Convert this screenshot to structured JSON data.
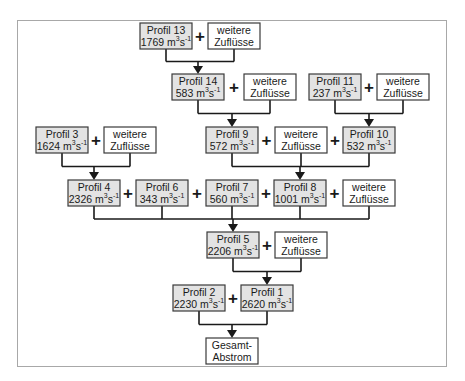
{
  "diagram": {
    "unit": "m3s-1",
    "colors": {
      "profile_fill": "#e3e3e3",
      "inflow_fill": "#ffffff",
      "line": "#1a1a1a"
    },
    "nodes": [
      {
        "id": "p13",
        "type": "profile",
        "name": "Profil 13",
        "value": "1769"
      },
      {
        "id": "w13",
        "type": "inflow",
        "line1": "weitere",
        "line2": "Zuflüsse"
      },
      {
        "id": "p14",
        "type": "profile",
        "name": "Profil 14",
        "value": "583"
      },
      {
        "id": "w14",
        "type": "inflow",
        "line1": "weitere",
        "line2": "Zuflüsse"
      },
      {
        "id": "p11",
        "type": "profile",
        "name": "Profil 11",
        "value": "237"
      },
      {
        "id": "w11",
        "type": "inflow",
        "line1": "weitere",
        "line2": "Zuflüsse"
      },
      {
        "id": "p3",
        "type": "profile",
        "name": "Profil 3",
        "value": "1624"
      },
      {
        "id": "w3",
        "type": "inflow",
        "line1": "weitere",
        "line2": "Zuflüsse"
      },
      {
        "id": "p9",
        "type": "profile",
        "name": "Profil 9",
        "value": "572"
      },
      {
        "id": "w9",
        "type": "inflow",
        "line1": "weitere",
        "line2": "Zuflüsse"
      },
      {
        "id": "p10",
        "type": "profile",
        "name": "Profil 10",
        "value": "532"
      },
      {
        "id": "p4",
        "type": "profile",
        "name": "Profil 4",
        "value": "2326"
      },
      {
        "id": "p6",
        "type": "profile",
        "name": "Profil 6",
        "value": "343"
      },
      {
        "id": "p7",
        "type": "profile",
        "name": "Profil 7",
        "value": "560"
      },
      {
        "id": "p8",
        "type": "profile",
        "name": "Profil 8",
        "value": "1001"
      },
      {
        "id": "w8",
        "type": "inflow",
        "line1": "weitere",
        "line2": "Zuflüsse"
      },
      {
        "id": "p5",
        "type": "profile",
        "name": "Profil 5",
        "value": "2206"
      },
      {
        "id": "w5",
        "type": "inflow",
        "line1": "weitere",
        "line2": "Zuflüsse"
      },
      {
        "id": "p2",
        "type": "profile",
        "name": "Profil 2",
        "value": "2230"
      },
      {
        "id": "p1",
        "type": "profile",
        "name": "Profil 1",
        "value": "2620"
      },
      {
        "id": "total",
        "type": "inflow",
        "line1": "Gesamt-",
        "line2": "Abstrom"
      }
    ],
    "plus_sign": "+",
    "flows": [
      {
        "from": [
          "p13",
          "w13"
        ],
        "to": "p14"
      },
      {
        "from": [
          "p14",
          "w14"
        ],
        "to": "p9"
      },
      {
        "from": [
          "p11",
          "w11"
        ],
        "to": "p10"
      },
      {
        "from": [
          "p3",
          "w3"
        ],
        "to": "p4"
      },
      {
        "from": [
          "p9",
          "w9",
          "p10"
        ],
        "to": "p8"
      },
      {
        "from": [
          "p4",
          "p6",
          "p7",
          "p8",
          "w8"
        ],
        "to": "p5"
      },
      {
        "from": [
          "p5",
          "w5"
        ],
        "to": "p1"
      },
      {
        "from": [
          "p2",
          "p1"
        ],
        "to": "total"
      }
    ]
  }
}
